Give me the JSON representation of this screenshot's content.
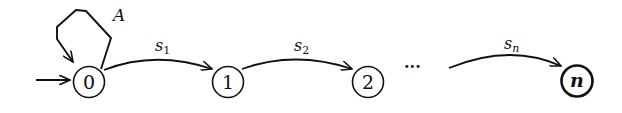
{
  "diagram": {
    "type": "state-automaton",
    "states": [
      {
        "id": "0",
        "label": "0",
        "initial": true,
        "final": false
      },
      {
        "id": "1",
        "label": "1",
        "initial": false,
        "final": false
      },
      {
        "id": "2",
        "label": "2",
        "initial": false,
        "final": false
      },
      {
        "id": "n",
        "label": "n",
        "initial": false,
        "final": true
      }
    ],
    "transitions": [
      {
        "from": "0",
        "to": "0",
        "label": "A"
      },
      {
        "from": "0",
        "to": "1",
        "label": "s",
        "subscript": "1"
      },
      {
        "from": "1",
        "to": "2",
        "label": "s",
        "subscript": "2"
      },
      {
        "from": "…",
        "to": "n",
        "label": "s",
        "subscript": "n"
      }
    ],
    "ellipsis": "···",
    "colors": {
      "stroke": "#111111",
      "background": "#ffffff"
    }
  }
}
